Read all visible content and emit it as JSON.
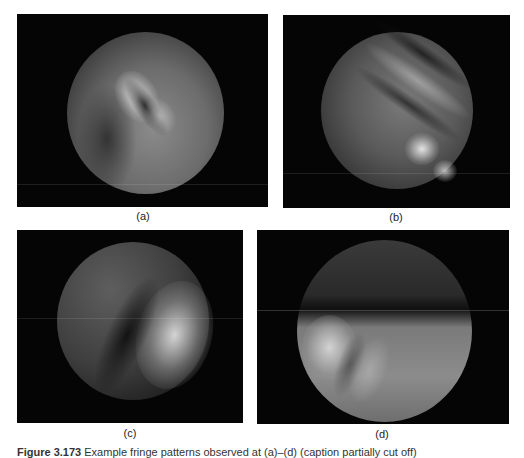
{
  "figure": {
    "panels": [
      {
        "id": "a",
        "label": "(a)",
        "description": "Circular fringe pattern with bright curved bands upper-center"
      },
      {
        "id": "b",
        "label": "(b)",
        "description": "Circular field with diagonal stripes upper-right and bright spots lower-right"
      },
      {
        "id": "c",
        "label": "(c)",
        "description": "Circular field, dim upper-left and bright region right"
      },
      {
        "id": "d",
        "label": "(d)",
        "description": "Circular field, dark upper band, bright lower half with bright spot left"
      }
    ],
    "caption": {
      "prefix": "Figure 3.173",
      "text": "Example fringe patterns observed at (a)–(d) (caption partially cut off)"
    }
  }
}
